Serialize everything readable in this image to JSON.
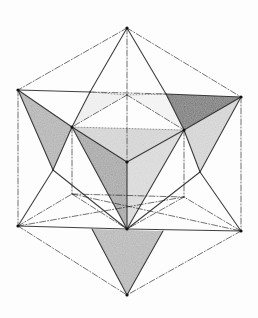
{
  "figure": {
    "background": "#fdfdfd",
    "stroke_color": "#1e1e1e",
    "vertices": {
      "T": [
        127,
        28
      ],
      "UL": [
        18,
        90
      ],
      "UR": [
        241,
        97
      ],
      "LL": [
        18,
        226
      ],
      "LR": [
        241,
        231
      ],
      "B": [
        127,
        295
      ],
      "BK": [
        127,
        95
      ],
      "IL": [
        72,
        127
      ],
      "IR": [
        184,
        130
      ],
      "C": [
        127,
        162
      ],
      "LIL": [
        72,
        194
      ],
      "LIR": [
        184,
        197
      ],
      "CL": [
        127,
        229
      ],
      "MU": [
        90,
        92
      ],
      "MUR": [
        166,
        94
      ],
      "LB1": [
        53,
        170
      ],
      "RB1": [
        200,
        172
      ],
      "BL2": [
        92,
        229
      ],
      "BR2": [
        163,
        231
      ]
    },
    "shaded_faces": [
      {
        "points": [
          "UL",
          "IL",
          "LB1"
        ],
        "fill": "#6e6e6e",
        "opacity": 0.55
      },
      {
        "points": [
          "MUR",
          "UR",
          "IR"
        ],
        "fill": "#3c3c3c",
        "opacity": 0.7
      },
      {
        "points": [
          "IR",
          "UR",
          "RB1"
        ],
        "fill": "#9a9a9a",
        "opacity": 0.45
      },
      {
        "points": [
          "IL",
          "C",
          "IR"
        ],
        "fill": "#7a7a7a",
        "opacity": 0.35
      },
      {
        "points": [
          "IL",
          "C",
          "CL"
        ],
        "fill": "#555555",
        "opacity": 0.55
      },
      {
        "points": [
          "C",
          "IR",
          "CL"
        ],
        "fill": "#9a9a9a",
        "opacity": 0.4
      },
      {
        "points": [
          "BL2",
          "BR2",
          "B"
        ],
        "fill": "#6a6a6a",
        "opacity": 0.5
      },
      {
        "points": [
          "MU",
          "BK",
          "IL"
        ],
        "fill": "#cfcfcf",
        "opacity": 0.35
      },
      {
        "points": [
          "BK",
          "MUR",
          "IR"
        ],
        "fill": "#d8d8d8",
        "opacity": 0.3
      }
    ],
    "solid_edges": [
      [
        "T",
        "MU"
      ],
      [
        "MU",
        "IL"
      ],
      [
        "T",
        "MUR"
      ],
      [
        "MUR",
        "IR"
      ],
      [
        "UL",
        "MU"
      ],
      [
        "MUR",
        "UR"
      ],
      [
        "UL",
        "IL"
      ],
      [
        "IL",
        "LB1"
      ],
      [
        "UL",
        "LB1"
      ],
      [
        "UR",
        "IR"
      ],
      [
        "UR",
        "RB1"
      ],
      [
        "IR",
        "RB1"
      ],
      [
        "IL",
        "C"
      ],
      [
        "C",
        "IR"
      ],
      [
        "C",
        "CL"
      ],
      [
        "IL",
        "CL"
      ],
      [
        "IR",
        "CL"
      ],
      [
        "LL",
        "CL"
      ],
      [
        "CL",
        "LR"
      ],
      [
        "BL2",
        "B"
      ],
      [
        "BR2",
        "B"
      ],
      [
        "LB1",
        "CL"
      ],
      [
        "RB1",
        "CL"
      ],
      [
        "LL",
        "LB1"
      ],
      [
        "LR",
        "RB1"
      ]
    ],
    "dashdot_edges": [
      [
        "T",
        "UL"
      ],
      [
        "T",
        "UR"
      ],
      [
        "UL",
        "LL"
      ],
      [
        "UR",
        "LR"
      ],
      [
        "LL",
        "B"
      ],
      [
        "LR",
        "B"
      ],
      [
        "T",
        "C"
      ],
      [
        "IL",
        "LIL"
      ],
      [
        "IR",
        "LIR"
      ],
      [
        "LL",
        "LIL"
      ],
      [
        "LIL",
        "CL"
      ],
      [
        "LR",
        "LIR"
      ],
      [
        "LIR",
        "CL"
      ],
      [
        "LIL",
        "LIR"
      ],
      [
        "LL",
        "LIR"
      ],
      [
        "LIL",
        "LR"
      ],
      [
        "BK",
        "IL"
      ],
      [
        "BK",
        "IR"
      ],
      [
        "MU",
        "MUR"
      ]
    ],
    "dotted_edges": [
      [
        "MU",
        "BK"
      ],
      [
        "BK",
        "MUR"
      ],
      [
        "IL",
        "IR"
      ]
    ]
  }
}
